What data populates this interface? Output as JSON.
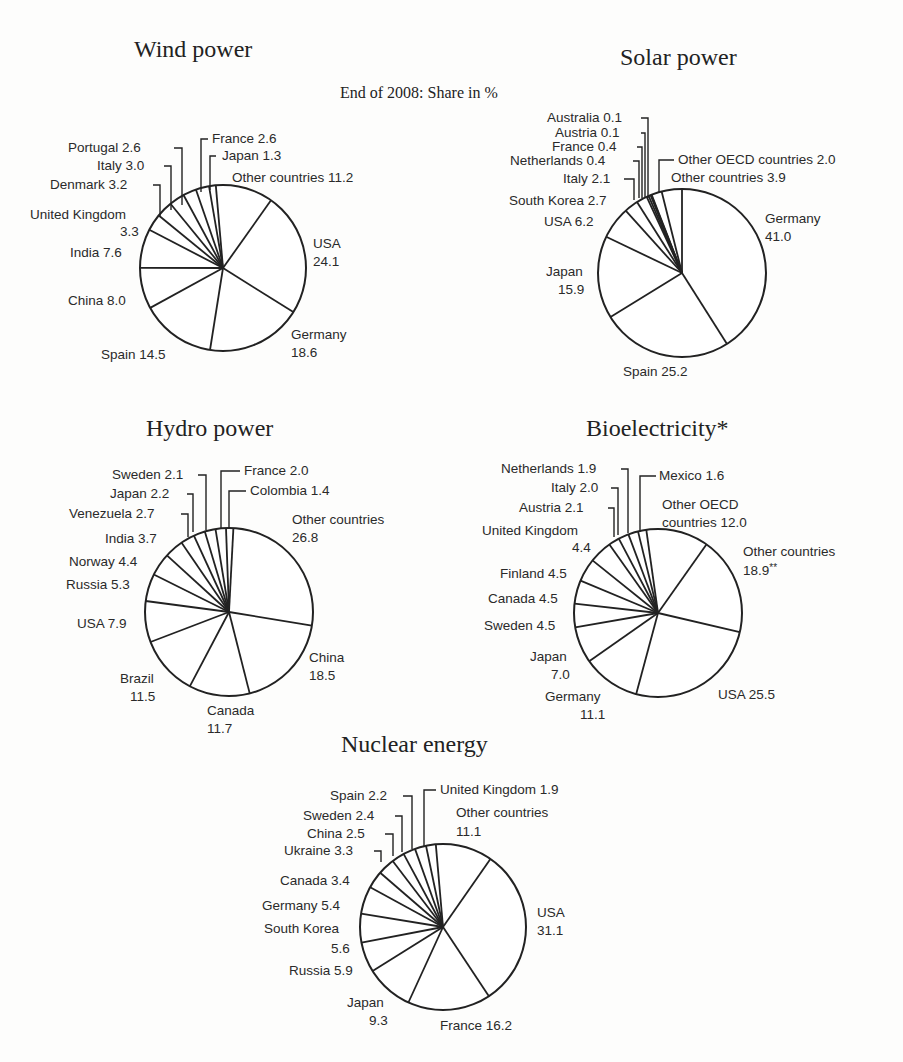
{
  "subtitle": "End of 2008: Share in %",
  "chart_data": [
    {
      "type": "pie",
      "title": "Wind power",
      "unit": "%",
      "slices": [
        {
          "label": "Other countries",
          "value": 11.2
        },
        {
          "label": "USA",
          "value": 24.1
        },
        {
          "label": "Germany",
          "value": 18.6
        },
        {
          "label": "Spain",
          "value": 14.5
        },
        {
          "label": "China",
          "value": 8.0
        },
        {
          "label": "India",
          "value": 7.6
        },
        {
          "label": "United Kingdom",
          "value": 3.3
        },
        {
          "label": "Denmark",
          "value": 3.2
        },
        {
          "label": "Italy",
          "value": 3.0
        },
        {
          "label": "Portugal",
          "value": 2.6
        },
        {
          "label": "France",
          "value": 2.6
        },
        {
          "label": "Japan",
          "value": 1.3
        }
      ]
    },
    {
      "type": "pie",
      "title": "Solar power",
      "unit": "%",
      "slices": [
        {
          "label": "Germany",
          "value": 41.0
        },
        {
          "label": "Spain",
          "value": 25.2
        },
        {
          "label": "Japan",
          "value": 15.9
        },
        {
          "label": "USA",
          "value": 6.2
        },
        {
          "label": "South Korea",
          "value": 2.7
        },
        {
          "label": "Italy",
          "value": 2.1
        },
        {
          "label": "Netherlands",
          "value": 0.4
        },
        {
          "label": "France",
          "value": 0.4
        },
        {
          "label": "Austria",
          "value": 0.1
        },
        {
          "label": "Australia",
          "value": 0.1
        },
        {
          "label": "Other OECD countries",
          "value": 2.0
        },
        {
          "label": "Other countries",
          "value": 3.9
        }
      ]
    },
    {
      "type": "pie",
      "title": "Hydro power",
      "unit": "%",
      "slices": [
        {
          "label": "Other countries",
          "value": 26.8
        },
        {
          "label": "China",
          "value": 18.5
        },
        {
          "label": "Canada",
          "value": 11.7
        },
        {
          "label": "Brazil",
          "value": 11.5
        },
        {
          "label": "USA",
          "value": 7.9
        },
        {
          "label": "Russia",
          "value": 5.3
        },
        {
          "label": "Norway",
          "value": 4.4
        },
        {
          "label": "India",
          "value": 3.7
        },
        {
          "label": "Venezuela",
          "value": 2.7
        },
        {
          "label": "Japan",
          "value": 2.2
        },
        {
          "label": "Sweden",
          "value": 2.1
        },
        {
          "label": "France",
          "value": 2.0
        },
        {
          "label": "Colombia",
          "value": 1.4
        }
      ]
    },
    {
      "type": "pie",
      "title": "Bioelectricity*",
      "unit": "%",
      "slices": [
        {
          "label": "Other OECD countries",
          "value": 12.0
        },
        {
          "label": "Other countries",
          "value": 18.9,
          "note": "**"
        },
        {
          "label": "USA",
          "value": 25.5
        },
        {
          "label": "Germany",
          "value": 11.1
        },
        {
          "label": "Japan",
          "value": 7.0
        },
        {
          "label": "Sweden",
          "value": 4.5
        },
        {
          "label": "Canada",
          "value": 4.5
        },
        {
          "label": "Finland",
          "value": 4.5
        },
        {
          "label": "United Kingdom",
          "value": 4.4
        },
        {
          "label": "Austria",
          "value": 2.1
        },
        {
          "label": "Italy",
          "value": 2.0
        },
        {
          "label": "Netherlands",
          "value": 1.9
        },
        {
          "label": "Mexico",
          "value": 1.6
        }
      ]
    },
    {
      "type": "pie",
      "title": "Nuclear energy",
      "unit": "%",
      "slices": [
        {
          "label": "Other countries",
          "value": 11.1
        },
        {
          "label": "USA",
          "value": 31.1
        },
        {
          "label": "France",
          "value": 16.2
        },
        {
          "label": "Japan",
          "value": 9.3
        },
        {
          "label": "Russia",
          "value": 5.9
        },
        {
          "label": "South Korea",
          "value": 5.6
        },
        {
          "label": "Germany",
          "value": 5.4
        },
        {
          "label": "Canada",
          "value": 3.4
        },
        {
          "label": "Ukraine",
          "value": 3.3
        },
        {
          "label": "China",
          "value": 2.5
        },
        {
          "label": "Sweden",
          "value": 2.4
        },
        {
          "label": "Spain",
          "value": 2.2
        },
        {
          "label": "United Kingdom",
          "value": 1.9
        }
      ]
    }
  ]
}
